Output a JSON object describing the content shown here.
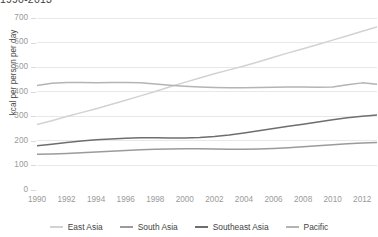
{
  "chart_title": "1990-2013",
  "y_axis_title": "kcal per person per day",
  "legend": {
    "items": [
      {
        "label": "East Asia",
        "color": "#d2d2d2"
      },
      {
        "label": "South Asia",
        "color": "#9b9b9b"
      },
      {
        "label": "Southeast Asia",
        "color": "#6e6e6e"
      },
      {
        "label": "Pacific",
        "color": "#b4b4b4"
      }
    ]
  },
  "colors": {
    "gridline": "#e8e8e8",
    "axis": "#d9d9d9",
    "tick_label": "#9a9a9a",
    "title": "#404040"
  },
  "chart_data": {
    "type": "line",
    "title": "1990-2013",
    "subtitle": "",
    "xlabel": "",
    "ylabel": "kcal per person per day",
    "xlim": [
      1990,
      2013
    ],
    "ylim": [
      0,
      700
    ],
    "yticks": [
      0,
      100,
      200,
      300,
      400,
      500,
      600,
      700
    ],
    "xticks": [
      1990,
      1992,
      1994,
      1996,
      1998,
      2000,
      2002,
      2004,
      2006,
      2008,
      2010,
      2012
    ],
    "xtick_labels": [
      "1990",
      "1992",
      "1994",
      "1996",
      "1998",
      "2000",
      "2002",
      "2004",
      "2006",
      "2008",
      "2010",
      "2012"
    ],
    "ytick_labels": [
      "0",
      "100",
      "200",
      "300",
      "400",
      "500",
      "600",
      "700"
    ],
    "grid": "horizontal",
    "legend_position": "bottom",
    "x": [
      1990,
      1991,
      1992,
      1993,
      1994,
      1995,
      1996,
      1997,
      1998,
      1999,
      2000,
      2001,
      2002,
      2003,
      2004,
      2005,
      2006,
      2007,
      2008,
      2009,
      2010,
      2011,
      2012,
      2013
    ],
    "series": [
      {
        "name": "East Asia",
        "color": "#d2d2d2",
        "values": [
          266,
          282,
          299,
          315,
          331,
          348,
          365,
          383,
          401,
          420,
          438,
          456,
          473,
          489,
          505,
          522,
          540,
          558,
          575,
          592,
          610,
          628,
          646,
          663
        ]
      },
      {
        "name": "South Asia",
        "color": "#9b9b9b",
        "values": [
          146,
          147,
          149,
          152,
          155,
          158,
          161,
          164,
          166,
          167,
          168,
          168,
          167,
          166,
          166,
          167,
          169,
          172,
          176,
          180,
          184,
          188,
          191,
          193
        ]
      },
      {
        "name": "Southeast Asia",
        "color": "#6e6e6e",
        "values": [
          180,
          186,
          193,
          199,
          204,
          208,
          211,
          213,
          213,
          212,
          212,
          214,
          218,
          224,
          232,
          241,
          250,
          259,
          268,
          277,
          286,
          294,
          300,
          305
        ]
      },
      {
        "name": "Pacific",
        "color": "#b4b4b4",
        "values": [
          425,
          434,
          437,
          437,
          436,
          437,
          438,
          436,
          431,
          426,
          422,
          419,
          417,
          416,
          416,
          417,
          418,
          419,
          419,
          418,
          419,
          428,
          436,
          430
        ]
      }
    ]
  }
}
